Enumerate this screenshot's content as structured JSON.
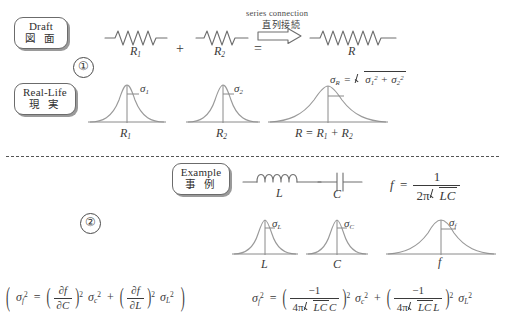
{
  "figure": {
    "title_absent": true,
    "sections": [
      {
        "number": "①",
        "rows": [
          {
            "label_en": "Draft",
            "label_jp": "図 面",
            "items": [
              "R₁",
              "+",
              "R₂",
              "=",
              "R"
            ],
            "annotation_en": "series connection",
            "annotation_jp": "直列接続"
          },
          {
            "label_en": "Real-Life",
            "label_jp": "現 実",
            "dist_labels": [
              "R₁",
              "R₂",
              "R = R₁ + R₂"
            ],
            "sigma_labels": [
              "σ₁",
              "σ₂",
              "σR"
            ],
            "result_formula": "σR = √(σ₁² + σ₂²)"
          }
        ]
      },
      {
        "number": "②",
        "label_en": "Example",
        "label_jp": "事 例",
        "components": [
          "L",
          "C"
        ],
        "frequency_formula": "f = 1 / (2π√(LC))",
        "dist_labels": [
          "L",
          "C",
          "f"
        ],
        "sigma_labels": [
          "σʟ",
          "σᴄ",
          "σꜰ"
        ],
        "formula_left": "σᶠ² = (∂f/∂C)² σᴄ² + (∂f/∂L)² σʟ²",
        "formula_right": "σᶠ² = (−1/(4π√(LC)C))² σᴄ² + (−1/(4π√(LC)L))² σʟ²"
      }
    ]
  },
  "labels": {
    "draft_en": "Draft",
    "draft_jp": "図 面",
    "reallife_en": "Real-Life",
    "reallife_jp": "現 実",
    "example_en": "Example",
    "example_jp": "事 例"
  },
  "annotations": {
    "series_en": "series connection",
    "series_jp": "直列接続"
  },
  "numbers": {
    "one": "①",
    "two": "②"
  },
  "section1": {
    "resistor1": "R",
    "resistor1_sub": "1",
    "plus": "+",
    "resistor2": "R",
    "resistor2_sub": "2",
    "equals": "=",
    "resistor_total": "R",
    "sigma1_name": "σ",
    "sigma1_sub": "1",
    "sigma2_name": "σ",
    "sigma2_sub": "2",
    "sigmaR_name": "σ",
    "sigmaR_sub": "R",
    "sigma_eq": "=",
    "sigma_sq1": "σ",
    "sigma_sq1_sub": "1",
    "sigma_sq1_sup": "2",
    "sigma_plus": "+",
    "sigma_sq2": "σ",
    "sigma_sq2_sub": "2",
    "sigma_sq2_sup": "2",
    "axis1_label": "R",
    "axis1_sub": "1",
    "axis2_label": "R",
    "axis2_sub": "2",
    "axis3_label": "R = R",
    "axis3_sub1": "1",
    "axis3_mid": " + R",
    "axis3_sub2": "2"
  },
  "section2": {
    "inductor_label": "L",
    "capacitor_label": "C",
    "freq_lhs": "f",
    "freq_eq": "=",
    "freq_num": "1",
    "freq_den_coef": "2π",
    "freq_den_rad": "LC",
    "sigmaL_name": "σ",
    "sigmaL_sub": "L",
    "sigmaC_name": "σ",
    "sigmaC_sub": "C",
    "sigmaf_name": "σ",
    "sigmaf_sub": "f",
    "axisL": "L",
    "axisC": "C",
    "axisf": "f"
  },
  "formula_left": {
    "lhs_sigma": "σ",
    "lhs_sub": "f",
    "lhs_sup": "2",
    "eq": "=",
    "d1_num": "∂f",
    "d1_den": "∂C",
    "p1_sup": "2",
    "s1_sigma": "σ",
    "s1_sub": "c",
    "s1_sup": "2",
    "plus": "+",
    "d2_num": "∂f",
    "d2_den": "∂L",
    "p2_sup": "2",
    "s2_sigma": "σ",
    "s2_sub": "L",
    "s2_sup": "2",
    "open": "(",
    "close": ")"
  },
  "formula_right": {
    "lhs_sigma": "σ",
    "lhs_sub": "f",
    "lhs_sup": "2",
    "eq": "=",
    "t1_num": "−1",
    "t1_den_coef": "4π",
    "t1_den_rad": "LC",
    "t1_den_tail": "C",
    "t1_sup": "2",
    "t1_sigma": "σ",
    "t1_sigma_sub": "c",
    "t1_sigma_sup": "2",
    "plus": "+",
    "t2_num": "−1",
    "t2_den_coef": "4π",
    "t2_den_rad": "LC",
    "t2_den_tail": "L",
    "t2_sup": "2",
    "t2_sigma": "σ",
    "t2_sigma_sub": "L",
    "t2_sigma_sup": "2"
  },
  "colors": {
    "ink": "#3a3a3a",
    "line": "#6e6e6e",
    "curve": "#9a9a9a",
    "background": "#ffffff"
  }
}
